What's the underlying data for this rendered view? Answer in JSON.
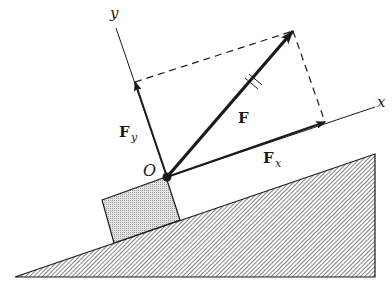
{
  "diagram": {
    "type": "force-decomposition-on-incline",
    "labels": {
      "y_axis": "y",
      "x_axis": "x",
      "origin": "O",
      "force": "F",
      "force_x_main": "F",
      "force_x_sub": "x",
      "force_y_main": "F",
      "force_y_sub": "y"
    },
    "points": {
      "origin": [
        167,
        177
      ],
      "force_tip": [
        293,
        31
      ],
      "force_x_tip": [
        325,
        122
      ],
      "force_y_tip": [
        135,
        82
      ],
      "y_axis_end": [
        116,
        28
      ],
      "x_axis_end": [
        375,
        107
      ]
    },
    "block": [
      [
        102,
        200
      ],
      [
        166,
        177
      ],
      [
        180,
        220
      ],
      [
        114,
        243
      ]
    ],
    "incline": [
      [
        15,
        277
      ],
      [
        375,
        154
      ],
      [
        375,
        277
      ]
    ],
    "colors": {
      "ink": "#1a1a1a",
      "block_fill": "#d6d6d6",
      "background": "#ffffff"
    }
  }
}
